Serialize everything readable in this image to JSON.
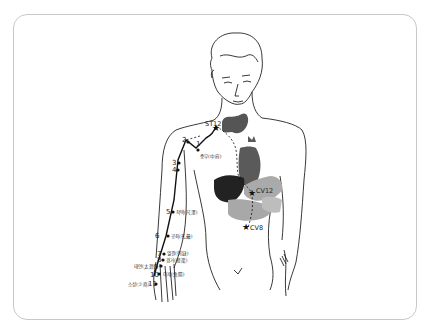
{
  "diagram": {
    "colors": {
      "outline": "#222222",
      "thyroid": "#555555",
      "heart": "#5a5a5a",
      "liver": "#222222",
      "stomach_intestine": "#a8a8a8",
      "meridian_path": "#111111"
    },
    "points": [
      {
        "num": "1",
        "name": "중부(中府)"
      },
      {
        "num": "2",
        "name": ""
      },
      {
        "num": "3",
        "name": ""
      },
      {
        "num": "4",
        "name": ""
      },
      {
        "num": "5",
        "name": "척택(尺澤)"
      },
      {
        "num": "6",
        "name": "공최(孔最)"
      },
      {
        "num": "7",
        "name": "열결(列缺)"
      },
      {
        "num": "8",
        "name": "경거(經渠)"
      },
      {
        "num": "9",
        "name": "태연(太淵)"
      },
      {
        "num": "10",
        "name": "어제(魚際)"
      },
      {
        "num": "11",
        "name": "소상(少商)"
      }
    ],
    "internal_points": [
      {
        "label": "ST12"
      },
      {
        "label": "CV12"
      },
      {
        "label": "CV8"
      }
    ]
  }
}
